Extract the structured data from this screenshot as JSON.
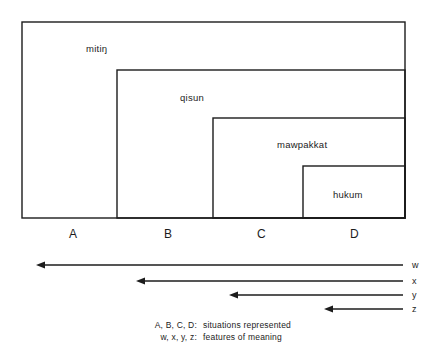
{
  "figure": {
    "type": "nested-boxes-scale-diagram",
    "background_color": "#ffffff",
    "line_color": "#1c1c1c"
  },
  "nested_boxes": [
    {
      "id": "box-a",
      "label": "mitiŋ",
      "situation": "A",
      "x": 22,
      "y": 22,
      "width": 383,
      "height": 196,
      "label_x": 86,
      "label_y": 44
    },
    {
      "id": "box-b",
      "label": "qisun",
      "situation": "B",
      "x": 117,
      "y": 70,
      "width": 288,
      "height": 148,
      "label_x": 180,
      "label_y": 93
    },
    {
      "id": "box-c",
      "label": "mawpakkat",
      "situation": "C",
      "x": 213,
      "y": 118,
      "width": 192,
      "height": 100,
      "label_x": 277,
      "label_y": 140
    },
    {
      "id": "box-d",
      "label": "hukum",
      "situation": "D",
      "x": 303,
      "y": 166,
      "width": 102,
      "height": 52,
      "label_x": 333,
      "label_y": 190
    }
  ],
  "situation_axis": {
    "labels": [
      {
        "text": "A",
        "x": 69,
        "y": 228
      },
      {
        "text": "B",
        "x": 164,
        "y": 228
      },
      {
        "text": "C",
        "x": 257,
        "y": 228
      },
      {
        "text": "D",
        "x": 350,
        "y": 228
      }
    ]
  },
  "feature_arrows": [
    {
      "id": "arrow-w",
      "label": "w",
      "y": 265,
      "tail_x": 403,
      "head_x": 37,
      "label_x": 412,
      "label_y": 261
    },
    {
      "id": "arrow-x",
      "label": "x",
      "y": 281,
      "tail_x": 403,
      "head_x": 137,
      "label_x": 412,
      "label_y": 277
    },
    {
      "id": "arrow-y",
      "label": "y",
      "y": 295,
      "tail_x": 403,
      "head_x": 230,
      "label_x": 412,
      "label_y": 291
    },
    {
      "id": "arrow-z",
      "label": "z",
      "y": 309,
      "tail_x": 403,
      "head_x": 325,
      "label_x": 412,
      "label_y": 305
    }
  ],
  "caption": {
    "line1_key": "A, B, C, D:",
    "line1_text": "situations represented",
    "line2_key": "w, x, y, z:",
    "line2_text": "features of meaning"
  }
}
